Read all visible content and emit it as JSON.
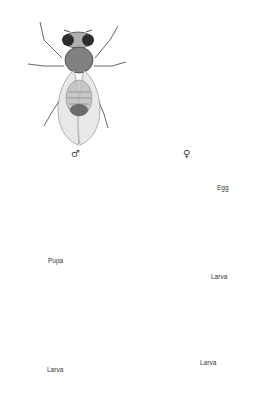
{
  "diagram": {
    "stages": [
      {
        "id": "male",
        "label": "♂",
        "kind": "adult"
      },
      {
        "id": "female",
        "label": "♀",
        "kind": "adult"
      },
      {
        "id": "egg",
        "label": "Egg",
        "kind": "egg"
      },
      {
        "id": "larva1",
        "label": "Larva",
        "kind": "larva"
      },
      {
        "id": "larva2",
        "label": "Larva",
        "kind": "larva"
      },
      {
        "id": "larva3",
        "label": "Larva",
        "kind": "larva"
      },
      {
        "id": "pupa",
        "label": "Pupa",
        "kind": "pupa"
      }
    ],
    "flow": [
      "female",
      "egg",
      "larva1",
      "larva2",
      "larva3",
      "pupa",
      "male"
    ],
    "colors": {
      "ink": "#3a3a3a",
      "body_dark": "#5a5a5a",
      "body_mid": "#9a9a9a",
      "wing": "#dcdcdc",
      "background": "#ffffff"
    }
  }
}
